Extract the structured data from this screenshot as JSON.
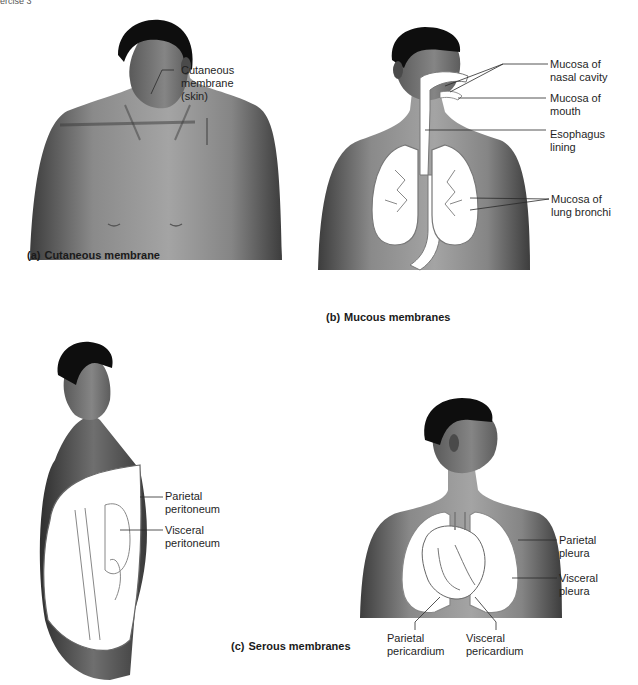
{
  "header": {
    "text": "ercise 3"
  },
  "panels": {
    "a": {
      "letter": "(a)",
      "caption": "Cutaneous membrane",
      "labels": [
        {
          "line1": "Cutaneous",
          "line2": "membrane",
          "line3": "(skin)"
        }
      ]
    },
    "b": {
      "letter": "(b)",
      "caption": "Mucous membranes",
      "labels": [
        {
          "line1": "Mucosa of",
          "line2": "nasal cavity"
        },
        {
          "line1": "Mucosa of",
          "line2": "mouth"
        },
        {
          "line1": "Esophagus",
          "line2": "lining"
        },
        {
          "line1": "Mucosa of",
          "line2": "lung bronchi"
        }
      ]
    },
    "c": {
      "letter": "(c)",
      "caption": "Serous membranes",
      "peritoneum_labels": [
        {
          "line1": "Parietal",
          "line2": "peritoneum"
        },
        {
          "line1": "Visceral",
          "line2": "peritoneum"
        }
      ],
      "pleura_labels": [
        {
          "line1": "Parietal",
          "line2": "pleura"
        },
        {
          "line1": "Visceral",
          "line2": "pleura"
        }
      ],
      "pericardium_labels": [
        {
          "line1": "Parietal",
          "line2": "pericardium"
        },
        {
          "line1": "Visceral",
          "line2": "pericardium"
        }
      ]
    }
  },
  "colors": {
    "skin_dark": "#3a3a3a",
    "skin_mid": "#7a7a7a",
    "skin_light": "#a8a8a8",
    "hair": "#0e0e0e",
    "membrane_fill": "#ffffff",
    "outline": "#6a6a6a"
  }
}
